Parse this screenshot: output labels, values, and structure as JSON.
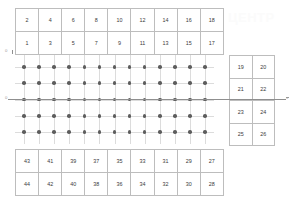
{
  "diagram": {
    "watermark_text": "ЦЕНТР",
    "colors": {
      "node": "#5d5d5d",
      "gridline": "#dcdcdc",
      "cell_border": "#bdbdbd",
      "axis": "#8f8f8f",
      "text": "#3a3a3a",
      "background": "#ffffff"
    }
  },
  "axes": {
    "x_label": "x",
    "y_label": "y",
    "origin_label": "0",
    "top_label": "0"
  },
  "tables": {
    "top": {
      "name": "top-element-table",
      "rows": [
        [
          "2",
          "4",
          "6",
          "8",
          "10",
          "12",
          "14",
          "16",
          "18"
        ],
        [
          "1",
          "3",
          "5",
          "7",
          "9",
          "11",
          "13",
          "15",
          "17"
        ]
      ]
    },
    "right": {
      "name": "right-element-table",
      "rows": [
        [
          "19",
          "20"
        ],
        [
          "21",
          "22"
        ],
        [
          "23",
          "24"
        ],
        [
          "25",
          "26"
        ]
      ]
    },
    "bottom": {
      "name": "bottom-element-table",
      "rows": [
        [
          "43",
          "41",
          "39",
          "37",
          "35",
          "33",
          "31",
          "29",
          "27"
        ],
        [
          "44",
          "42",
          "40",
          "38",
          "36",
          "34",
          "32",
          "30",
          "28"
        ]
      ]
    }
  },
  "grid": {
    "columns": 13,
    "rows": 5,
    "node_count": 65,
    "description": "Regular rectangular lattice of node points at gridline intersections"
  }
}
